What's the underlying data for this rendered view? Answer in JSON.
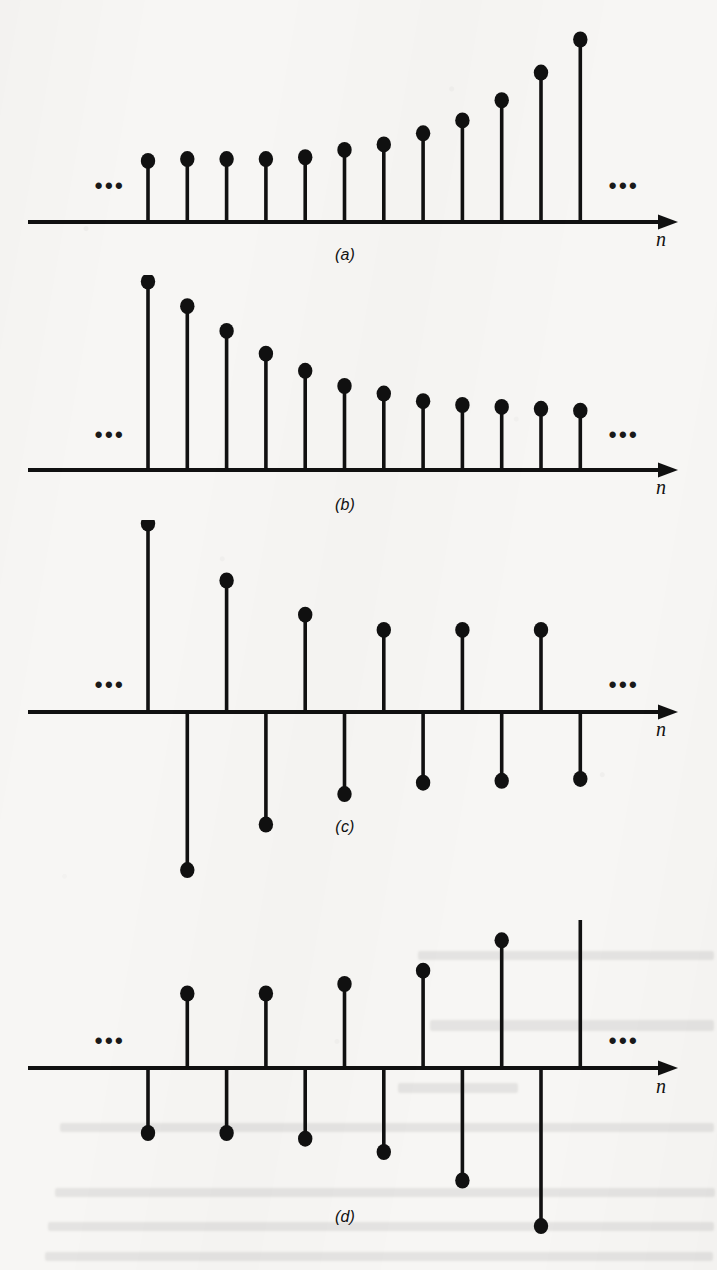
{
  "figure": {
    "axis_variable": "n",
    "ellipsis_glyph": "•••",
    "ink_color": "#111111",
    "paper_color": "#f7f6f4"
  },
  "panels": [
    {
      "label": "(a)",
      "axis_variable": "n",
      "ellipsis_left": "•••",
      "ellipsis_right": "•••",
      "description": "growing exponential sequence, all samples positive"
    },
    {
      "label": "(b)",
      "axis_variable": "n",
      "ellipsis_left": "•••",
      "ellipsis_right": "•••",
      "description": "decaying exponential sequence, all samples positive"
    },
    {
      "label": "(c)",
      "axis_variable": "n",
      "ellipsis_left": "•••",
      "ellipsis_right": "•••",
      "description": "alternating-sign decaying exponential sequence"
    },
    {
      "label": "(d)",
      "axis_variable": "n",
      "ellipsis_left": "•••",
      "ellipsis_right": "•••",
      "description": "alternating-sign growing exponential sequence"
    }
  ],
  "chart_data": [
    {
      "type": "stem",
      "panel": "(a)",
      "title": "",
      "xlabel": "n",
      "ylabel": "",
      "grid": false,
      "legend": false,
      "x": [
        1,
        2,
        3,
        4,
        5,
        6,
        7,
        8,
        9,
        10,
        11,
        12
      ],
      "values": [
        0.34,
        0.35,
        0.35,
        0.35,
        0.36,
        0.4,
        0.43,
        0.49,
        0.56,
        0.67,
        0.82,
        1.0
      ],
      "ylim": [
        0,
        1.05
      ],
      "baseline": 0
    },
    {
      "type": "stem",
      "panel": "(b)",
      "title": "",
      "xlabel": "n",
      "ylabel": "",
      "grid": false,
      "legend": false,
      "x": [
        1,
        2,
        3,
        4,
        5,
        6,
        7,
        8,
        9,
        10,
        11,
        12
      ],
      "values": [
        1.0,
        0.87,
        0.74,
        0.62,
        0.53,
        0.45,
        0.41,
        0.37,
        0.35,
        0.34,
        0.33,
        0.32
      ],
      "ylim": [
        0,
        1.05
      ],
      "baseline": 0
    },
    {
      "type": "stem",
      "panel": "(c)",
      "title": "",
      "xlabel": "n",
      "ylabel": "",
      "grid": false,
      "legend": false,
      "x": [
        1,
        2,
        3,
        4,
        5,
        6,
        7,
        8,
        9,
        10,
        11,
        12
      ],
      "values": [
        1.0,
        -0.84,
        0.7,
        -0.6,
        0.52,
        -0.44,
        0.44,
        -0.38,
        0.44,
        -0.37,
        0.44,
        -0.36
      ],
      "ylim": [
        -0.9,
        1.05
      ],
      "baseline": 0
    },
    {
      "type": "stem",
      "panel": "(d)",
      "title": "",
      "xlabel": "n",
      "ylabel": "",
      "grid": false,
      "legend": false,
      "x": [
        1,
        2,
        3,
        4,
        5,
        6,
        7,
        8,
        9,
        10,
        11,
        12
      ],
      "values": [
        -0.35,
        0.4,
        -0.35,
        0.4,
        -0.38,
        0.45,
        -0.45,
        0.52,
        -0.6,
        0.68,
        -0.84,
        1.0
      ],
      "ylim": [
        -0.9,
        1.05
      ],
      "baseline": 0
    }
  ]
}
